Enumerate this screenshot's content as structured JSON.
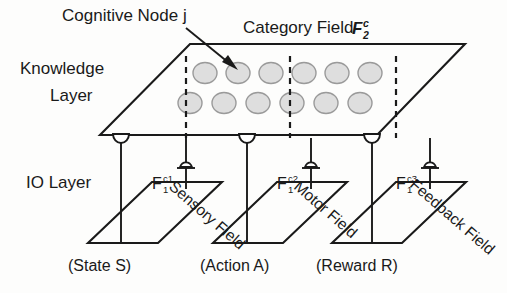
{
  "figure": {
    "type": "neural-network-architecture-diagram",
    "annotations": {
      "cognitive_node": "Cognitive Node j",
      "knowledge_layer_line1": "Knowledge",
      "knowledge_layer_line2": "Layer",
      "io_layer": "IO Layer"
    },
    "category_field": {
      "label": "Category Field",
      "symbol_base": "F",
      "symbol_sup": "c",
      "symbol_sub": "2"
    },
    "knowledge_nodes": {
      "rows": 2,
      "per_row": 6,
      "fill_color": "#dedede",
      "stroke_color": "#9a9a9a",
      "highlighted_index": 1
    },
    "io_fields": [
      {
        "field_name": "Sensory Field",
        "symbol_base": "F",
        "symbol_sub": "1",
        "symbol_sup": "c1",
        "caption": "(State S)"
      },
      {
        "field_name": "Motor Field",
        "symbol_base": "F",
        "symbol_sub": "1",
        "symbol_sup": "c2",
        "caption": "(Action A)"
      },
      {
        "field_name": "Feedback Field",
        "symbol_base": "F",
        "symbol_sub": "1",
        "symbol_sup": "c3",
        "caption": "(Reward R)"
      }
    ],
    "colors": {
      "ink": "#1a1a1a",
      "background": "#fdfdfc",
      "node_fill": "#dedede"
    }
  }
}
